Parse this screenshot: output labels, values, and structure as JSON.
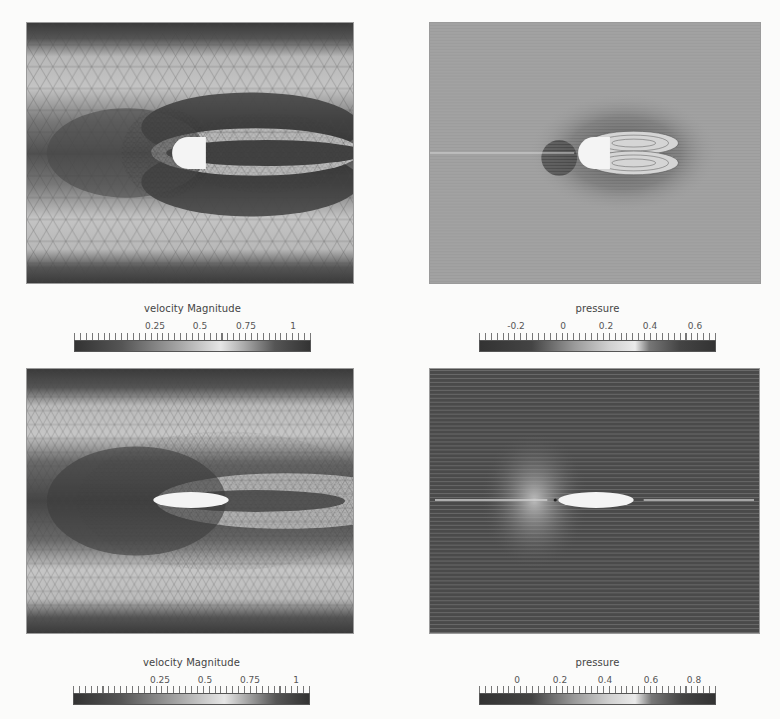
{
  "figure": {
    "panels": [
      {
        "id": "top-left",
        "field": "velocity Magnitude",
        "body_shape": "half-disk-blunt",
        "view": "mesh-with-contours"
      },
      {
        "id": "top-right",
        "field": "pressure",
        "body_shape": "half-disk-blunt",
        "view": "streamlines"
      },
      {
        "id": "bottom-left",
        "field": "velocity Magnitude",
        "body_shape": "ellipse",
        "view": "mesh-with-contours"
      },
      {
        "id": "bottom-right",
        "field": "pressure",
        "body_shape": "ellipse",
        "view": "streamlines"
      }
    ],
    "colorbars": [
      {
        "title": "velocity Magnitude",
        "ticks": [
          "0.25",
          "0.5",
          "0.75",
          "1"
        ],
        "tick_positions": [
          0.34,
          0.53,
          0.73,
          0.92
        ]
      },
      {
        "title": "pressure",
        "ticks": [
          "-0.2",
          "0",
          "0.2",
          "0.4",
          "0.6"
        ],
        "tick_positions": [
          0.15,
          0.35,
          0.53,
          0.72,
          0.91
        ]
      },
      {
        "title": "velocity Magnitude",
        "ticks": [
          "0.25",
          "0.5",
          "0.75",
          "1"
        ],
        "tick_positions": [
          0.36,
          0.55,
          0.74,
          0.93
        ]
      },
      {
        "title": "pressure",
        "ticks": [
          "0",
          "0.2",
          "0.4",
          "0.6",
          "0.8"
        ],
        "tick_positions": [
          0.16,
          0.34,
          0.53,
          0.72,
          0.9
        ]
      }
    ],
    "colormap": {
      "low": "#2e2e2e",
      "mid": "#e8e8e8",
      "high": "#2e2e2e"
    }
  }
}
